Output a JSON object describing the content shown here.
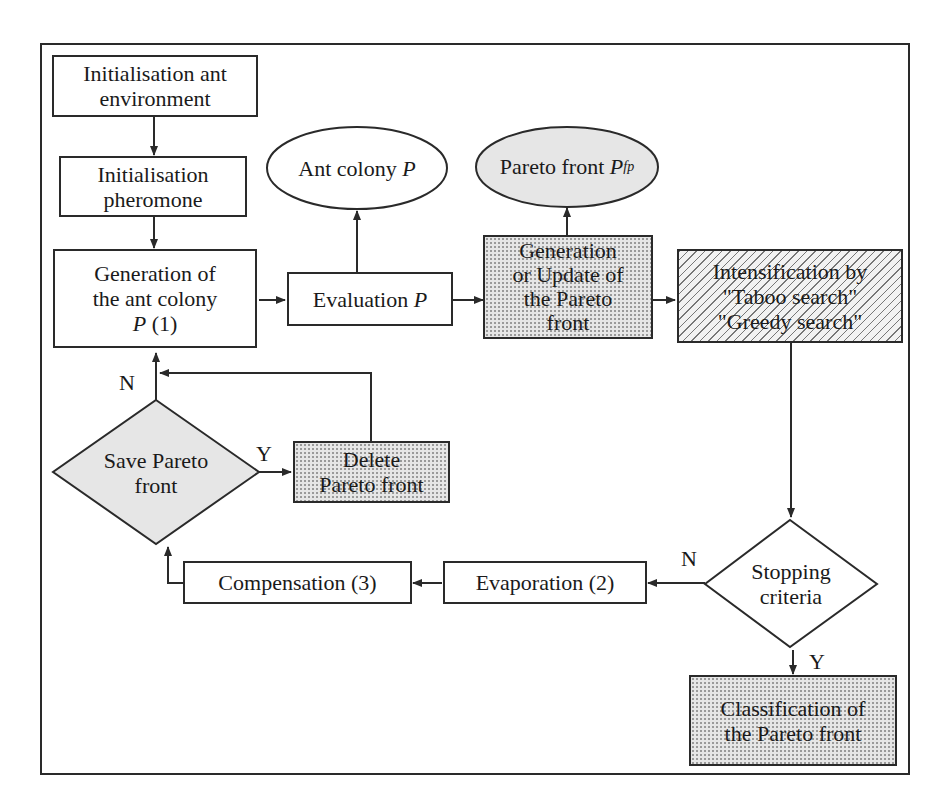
{
  "diagram": {
    "type": "flowchart",
    "colors": {
      "line": "#2a2a2a",
      "dotted_fill": "#e6e6e6",
      "hatched_fill": "#f2f2f2",
      "background": "#ffffff"
    },
    "nodes": {
      "init_env": {
        "line1": "Initialisation ant",
        "line2": "environment"
      },
      "init_pher": {
        "line1": "Initialisation",
        "line2": "pheromone"
      },
      "generation": {
        "line1": "Generation of",
        "line2": "the ant colony",
        "line3_var": "P",
        "line3_rest": " (1)"
      },
      "evaluation": {
        "text": "Evaluation ",
        "var": "P"
      },
      "ant_colony": {
        "text": "Ant colony ",
        "var": "P"
      },
      "pareto_front": {
        "text": "Pareto front ",
        "var": "P",
        "subscript": "fp"
      },
      "update_pareto": {
        "line1": "Generation",
        "line2": "or Update of",
        "line3": "the Pareto",
        "line4": "front"
      },
      "intensification": {
        "line1": "Intensification by",
        "line2": "\"Taboo search\"",
        "line3": "\"Greedy search\""
      },
      "save_pareto": {
        "line1": "Save Pareto",
        "line2": "front"
      },
      "delete_pareto": {
        "line1": "Delete",
        "line2": "Pareto front"
      },
      "stopping": {
        "line1": "Stopping",
        "line2": "criteria"
      },
      "evaporation": {
        "text": "Evaporation (2)"
      },
      "compensation": {
        "text": "Compensation (3)"
      },
      "classification": {
        "line1": "Classification of",
        "line2": "the Pareto front"
      }
    },
    "edge_labels": {
      "save_no": "N",
      "save_yes": "Y",
      "stop_no": "N",
      "stop_yes": "Y"
    }
  }
}
